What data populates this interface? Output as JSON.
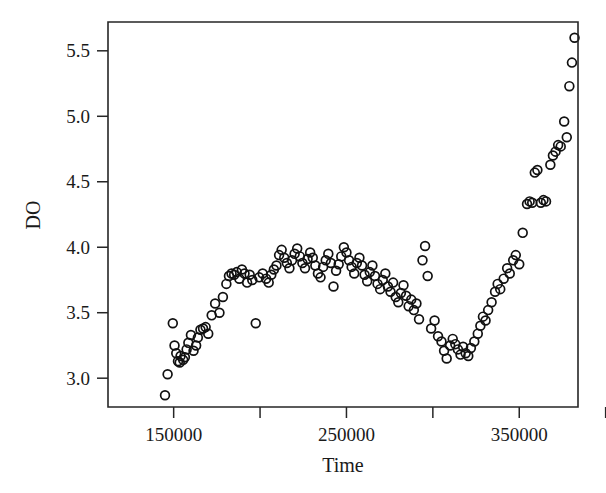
{
  "chart_data": {
    "type": "scatter",
    "title": "",
    "xlabel": "Time",
    "ylabel": "DO",
    "xlim": [
      112000,
      384000
    ],
    "ylim": [
      2.78,
      5.72
    ],
    "grid": false,
    "legend": "none",
    "marker": "open-circle",
    "marker_color": "#111111",
    "x_ticks": [
      150000,
      200000,
      250000,
      300000,
      350000,
      400000
    ],
    "x_tick_labels": [
      "150000",
      "",
      "250000",
      "",
      "350000",
      ""
    ],
    "y_ticks": [
      3.0,
      3.5,
      4.0,
      4.5,
      5.0,
      5.5
    ],
    "y_tick_labels": [
      "3.0",
      "3.5",
      "4.0",
      "4.5",
      "5.0",
      "5.5"
    ],
    "n_points": 146,
    "points": [
      [
        145000,
        2.87
      ],
      [
        146500,
        3.03
      ],
      [
        149500,
        3.42
      ],
      [
        150500,
        3.25
      ],
      [
        151500,
        3.19
      ],
      [
        152500,
        3.13
      ],
      [
        153500,
        3.12
      ],
      [
        154000,
        3.17
      ],
      [
        155500,
        3.14
      ],
      [
        156500,
        3.16
      ],
      [
        157500,
        3.22
      ],
      [
        158500,
        3.27
      ],
      [
        160000,
        3.33
      ],
      [
        161500,
        3.21
      ],
      [
        163000,
        3.25
      ],
      [
        164000,
        3.31
      ],
      [
        165500,
        3.37
      ],
      [
        167000,
        3.38
      ],
      [
        168500,
        3.39
      ],
      [
        170000,
        3.34
      ],
      [
        172000,
        3.48
      ],
      [
        174000,
        3.57
      ],
      [
        176500,
        3.5
      ],
      [
        178500,
        3.62
      ],
      [
        180500,
        3.72
      ],
      [
        182000,
        3.78
      ],
      [
        183500,
        3.8
      ],
      [
        185000,
        3.79
      ],
      [
        186500,
        3.81
      ],
      [
        188000,
        3.76
      ],
      [
        189500,
        3.83
      ],
      [
        191000,
        3.8
      ],
      [
        192500,
        3.73
      ],
      [
        194000,
        3.79
      ],
      [
        195500,
        3.75
      ],
      [
        197500,
        3.42
      ],
      [
        199500,
        3.77
      ],
      [
        201500,
        3.8
      ],
      [
        203500,
        3.76
      ],
      [
        205000,
        3.73
      ],
      [
        206500,
        3.79
      ],
      [
        208000,
        3.83
      ],
      [
        209500,
        3.86
      ],
      [
        211000,
        3.94
      ],
      [
        212500,
        3.98
      ],
      [
        214000,
        3.92
      ],
      [
        215500,
        3.88
      ],
      [
        217000,
        3.84
      ],
      [
        218500,
        3.9
      ],
      [
        220000,
        3.95
      ],
      [
        221500,
        3.99
      ],
      [
        223000,
        3.93
      ],
      [
        224500,
        3.88
      ],
      [
        226000,
        3.84
      ],
      [
        227500,
        3.91
      ],
      [
        229000,
        3.96
      ],
      [
        230500,
        3.92
      ],
      [
        232000,
        3.86
      ],
      [
        233500,
        3.8
      ],
      [
        235000,
        3.77
      ],
      [
        236500,
        3.85
      ],
      [
        238000,
        3.9
      ],
      [
        239500,
        3.95
      ],
      [
        241000,
        3.88
      ],
      [
        242500,
        3.7
      ],
      [
        244000,
        3.82
      ],
      [
        245500,
        3.87
      ],
      [
        247000,
        3.93
      ],
      [
        248500,
        4.0
      ],
      [
        250000,
        3.96
      ],
      [
        251500,
        3.9
      ],
      [
        253000,
        3.85
      ],
      [
        254500,
        3.8
      ],
      [
        256000,
        3.88
      ],
      [
        257500,
        3.92
      ],
      [
        259000,
        3.86
      ],
      [
        260500,
        3.79
      ],
      [
        262000,
        3.74
      ],
      [
        263500,
        3.81
      ],
      [
        265000,
        3.86
      ],
      [
        266500,
        3.78
      ],
      [
        268000,
        3.72
      ],
      [
        269500,
        3.68
      ],
      [
        271000,
        3.75
      ],
      [
        272500,
        3.8
      ],
      [
        274000,
        3.7
      ],
      [
        275500,
        3.66
      ],
      [
        277000,
        3.73
      ],
      [
        278500,
        3.62
      ],
      [
        280000,
        3.58
      ],
      [
        281500,
        3.65
      ],
      [
        283000,
        3.71
      ],
      [
        284500,
        3.63
      ],
      [
        286000,
        3.55
      ],
      [
        287500,
        3.6
      ],
      [
        289000,
        3.52
      ],
      [
        290500,
        3.57
      ],
      [
        292000,
        3.45
      ],
      [
        294000,
        3.9
      ],
      [
        295500,
        4.01
      ],
      [
        297000,
        3.78
      ],
      [
        299000,
        3.38
      ],
      [
        301000,
        3.44
      ],
      [
        303000,
        3.32
      ],
      [
        305000,
        3.28
      ],
      [
        306500,
        3.21
      ],
      [
        308000,
        3.15
      ],
      [
        310000,
        3.25
      ],
      [
        311500,
        3.3
      ],
      [
        313000,
        3.26
      ],
      [
        314500,
        3.22
      ],
      [
        316000,
        3.18
      ],
      [
        317500,
        3.24
      ],
      [
        319000,
        3.19
      ],
      [
        320500,
        3.17
      ],
      [
        322000,
        3.23
      ],
      [
        324000,
        3.28
      ],
      [
        326000,
        3.34
      ],
      [
        327500,
        3.4
      ],
      [
        329000,
        3.47
      ],
      [
        330500,
        3.44
      ],
      [
        332000,
        3.52
      ],
      [
        334000,
        3.58
      ],
      [
        336000,
        3.66
      ],
      [
        337500,
        3.72
      ],
      [
        339000,
        3.68
      ],
      [
        341000,
        3.76
      ],
      [
        343000,
        3.84
      ],
      [
        344500,
        3.8
      ],
      [
        346500,
        3.9
      ],
      [
        348000,
        3.94
      ],
      [
        350000,
        3.87
      ],
      [
        352000,
        4.11
      ],
      [
        354500,
        4.33
      ],
      [
        356000,
        4.35
      ],
      [
        357500,
        4.34
      ],
      [
        359000,
        4.57
      ],
      [
        360500,
        4.59
      ],
      [
        362500,
        4.34
      ],
      [
        364000,
        4.36
      ],
      [
        365500,
        4.35
      ],
      [
        368000,
        4.63
      ],
      [
        369500,
        4.7
      ],
      [
        371000,
        4.73
      ],
      [
        372500,
        4.78
      ],
      [
        374000,
        4.77
      ],
      [
        376000,
        4.96
      ],
      [
        377500,
        4.84
      ],
      [
        379000,
        5.23
      ],
      [
        380500,
        5.41
      ],
      [
        382000,
        5.6
      ]
    ]
  },
  "axes": {
    "x_title": "Time",
    "y_title": "DO"
  }
}
